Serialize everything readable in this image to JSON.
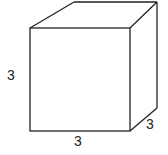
{
  "diagram": {
    "shape": "cube",
    "labels": {
      "height": "3",
      "width": "3",
      "depth": "3"
    },
    "stroke_color": "#222222"
  }
}
